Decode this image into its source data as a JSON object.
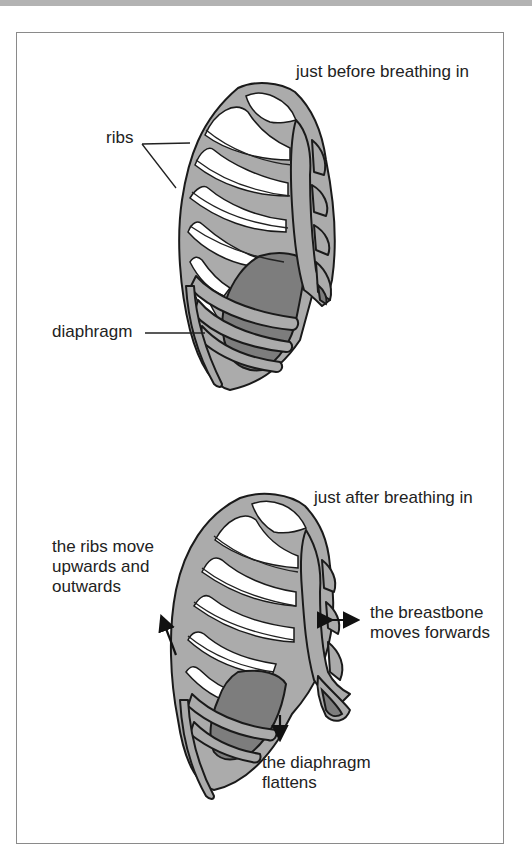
{
  "colors": {
    "bone": "#ababab",
    "diaphragm": "#7d7d7d",
    "outline": "#1a1a1a",
    "frame": "#8a8a8a",
    "topbar": "#b3b3b3"
  },
  "panels": [
    {
      "title": "just before breathing in",
      "labels": {
        "ribs": "ribs",
        "diaphragm": "diaphragm"
      }
    },
    {
      "title": "just after breathing in",
      "labels": {
        "ribs_move": "the ribs move\nupwards and\noutwards",
        "breastbone": "the breastbone\nmoves forwards",
        "diaphragm": "the diaphragm\nflattens"
      }
    }
  ]
}
